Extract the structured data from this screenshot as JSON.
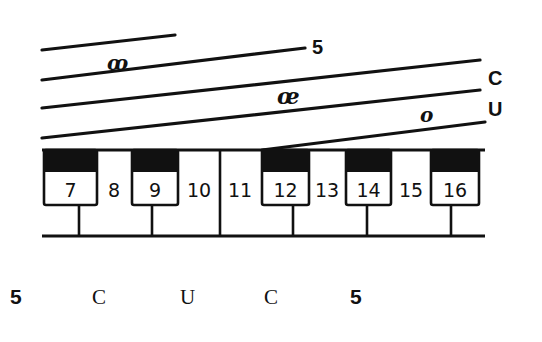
{
  "diagram": {
    "type": "keyboard-tablature",
    "stroke_color": "#111111",
    "background": "#ffffff",
    "staff_lines": [
      {
        "name": "short-top",
        "x1": 42,
        "y1": 50,
        "x2": 175,
        "y2": 35,
        "label": ""
      },
      {
        "name": "line-5",
        "x1": 42,
        "y1": 80,
        "x2": 305,
        "y2": 48,
        "label": "5",
        "label_x": 312,
        "label_y": 54
      },
      {
        "name": "line-c",
        "x1": 42,
        "y1": 108,
        "x2": 480,
        "y2": 60,
        "label": "C",
        "label_x": 488,
        "label_y": 85
      },
      {
        "name": "line-u",
        "x1": 42,
        "y1": 138,
        "x2": 480,
        "y2": 90,
        "label": "U",
        "label_x": 488,
        "label_y": 116
      },
      {
        "name": "line-to-key-12",
        "x1": 262,
        "y1": 150,
        "x2": 485,
        "y2": 122,
        "label": ""
      }
    ],
    "script_marks": [
      {
        "name": "script-mark-1",
        "text": "ꝏ",
        "x": 107,
        "y": 70,
        "size": 20
      },
      {
        "name": "script-mark-2",
        "text": "œ",
        "x": 277,
        "y": 104,
        "size": 22
      },
      {
        "name": "script-mark-3",
        "text": "o",
        "x": 420,
        "y": 122,
        "size": 20
      }
    ],
    "keyboard": {
      "top_y": 150,
      "bottom_y": 236,
      "left_x": 42,
      "right_x": 485,
      "black_bottom_y": 172,
      "box_bottom_y": 205,
      "divider_x": 220,
      "black_keys": [
        {
          "number": "7",
          "x1": 44,
          "x2": 97,
          "stem_x": 79
        },
        {
          "number": "9",
          "x1": 132,
          "x2": 178,
          "stem_x": 152
        },
        {
          "number": "12",
          "x1": 262,
          "x2": 309,
          "stem_x": 293
        },
        {
          "number": "14",
          "x1": 346,
          "x2": 391,
          "stem_x": 367
        },
        {
          "number": "16",
          "x1": 431,
          "x2": 479,
          "stem_x": 451
        }
      ],
      "gap_numbers": [
        {
          "number": "8",
          "x": 114
        },
        {
          "number": "10",
          "x": 199
        },
        {
          "number": "11",
          "x": 240
        },
        {
          "number": "13",
          "x": 327
        },
        {
          "number": "15",
          "x": 411
        }
      ]
    },
    "bottom_labels": [
      {
        "text": "5",
        "x": 10,
        "style": "bold"
      },
      {
        "text": "C",
        "x": 92,
        "style": "plain"
      },
      {
        "text": "U",
        "x": 180,
        "style": "plain"
      },
      {
        "text": "C",
        "x": 264,
        "style": "plain"
      },
      {
        "text": "5",
        "x": 350,
        "style": "bold"
      }
    ]
  }
}
